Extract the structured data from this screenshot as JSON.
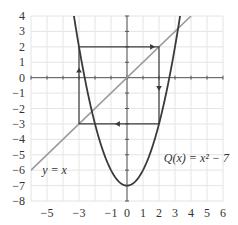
{
  "chart_data": {
    "type": "line",
    "title": "",
    "xlabel": "",
    "ylabel": "",
    "xlim": [
      -6,
      6
    ],
    "ylim": [
      -8,
      4
    ],
    "grid": true,
    "x_ticks": [
      -6,
      -5,
      -4,
      -3,
      -2,
      -1,
      0,
      1,
      2,
      3,
      4,
      5,
      6
    ],
    "x_tick_labels": [
      "−5",
      "−3",
      "−1",
      "0",
      "1",
      "2",
      "3",
      "4",
      "5",
      "6"
    ],
    "x_tick_label_values": [
      -5,
      -3,
      -1,
      0,
      1,
      2,
      3,
      4,
      5,
      6
    ],
    "y_tick_labels": [
      "4",
      "3",
      "2",
      "1",
      "0",
      "−1",
      "−2",
      "−3",
      "−4",
      "−5",
      "−6",
      "−7",
      "−8"
    ],
    "y_tick_label_values": [
      4,
      3,
      2,
      1,
      0,
      -1,
      -2,
      -3,
      -4,
      -5,
      -6,
      -7,
      -8
    ],
    "series": [
      {
        "name": "Q(x) = x² − 7",
        "kind": "function",
        "expression": "x^2 - 7",
        "color": "#3a3a3a"
      },
      {
        "name": "y = x",
        "kind": "function",
        "expression": "x",
        "color": "#9a9a9a"
      },
      {
        "name": "cobweb 2-cycle",
        "kind": "path",
        "points": [
          [
            -3,
            -3
          ],
          [
            -3,
            2
          ],
          [
            2,
            2
          ],
          [
            2,
            -3
          ],
          [
            -3,
            -3
          ]
        ],
        "arrows": [
          {
            "at": [
              -3,
              0.5
            ],
            "direction": "up"
          },
          {
            "at": [
              1.6,
              2
            ],
            "direction": "right"
          },
          {
            "at": [
              2,
              -0.7
            ],
            "direction": "down"
          },
          {
            "at": [
              -0.6,
              -3
            ],
            "direction": "left"
          }
        ],
        "color": "#3a3a3a"
      }
    ],
    "annotations": [
      {
        "text": "Q(x) = x² − 7",
        "at": [
          2.3,
          -5.2
        ]
      },
      {
        "text": "y = x",
        "at": [
          -5.3,
          -6
        ]
      }
    ],
    "colors": {
      "grid": "#e4e4e4",
      "axis": "#555555",
      "parabola": "#3a3a3a",
      "identity_line": "#9a9a9a",
      "cobweb": "#3a3a3a"
    }
  }
}
